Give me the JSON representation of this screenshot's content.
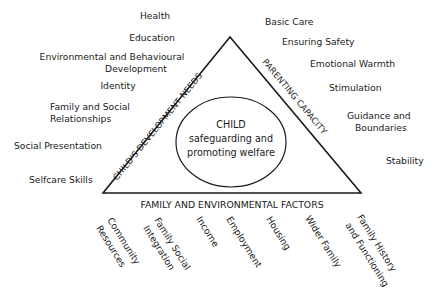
{
  "diagram": {
    "center": {
      "line1": "CHILD",
      "line2": "safeguarding and",
      "line3": "promoting welfare"
    },
    "edges": {
      "left": "CHILD'S DEVELOPMENT NEEDS",
      "right": "PARENTING CAPACITY",
      "bottom": "FAMILY AND ENVIRONMENTAL FACTORS"
    },
    "child_development_needs": [
      {
        "lines": [
          "Health"
        ]
      },
      {
        "lines": [
          "Education"
        ]
      },
      {
        "lines": [
          "Environmental and Behavioural",
          "Development"
        ]
      },
      {
        "lines": [
          "Identity"
        ]
      },
      {
        "lines": [
          "Family and Social",
          "Relationships"
        ]
      },
      {
        "lines": [
          "Social Presentation"
        ]
      },
      {
        "lines": [
          "Selfcare Skills"
        ]
      }
    ],
    "parenting_capacity": [
      {
        "lines": [
          "Basic Care"
        ]
      },
      {
        "lines": [
          "Ensuring Safety"
        ]
      },
      {
        "lines": [
          "Emotional Warmth"
        ]
      },
      {
        "lines": [
          "Stimulation"
        ]
      },
      {
        "lines": [
          "Guidance and",
          "Boundaries"
        ]
      },
      {
        "lines": [
          "Stability"
        ]
      }
    ],
    "family_environmental_factors": [
      {
        "lines": [
          "Community",
          "Resources"
        ]
      },
      {
        "lines": [
          "Family Social",
          "Integration"
        ]
      },
      {
        "lines": [
          "Income"
        ]
      },
      {
        "lines": [
          "Employment"
        ]
      },
      {
        "lines": [
          "Housing"
        ]
      },
      {
        "lines": [
          "Wider Family"
        ]
      },
      {
        "lines": [
          "Family History",
          "and Functioning"
        ]
      }
    ],
    "colors": {
      "stroke": "#1a1a1a",
      "background": "#ffffff"
    }
  }
}
